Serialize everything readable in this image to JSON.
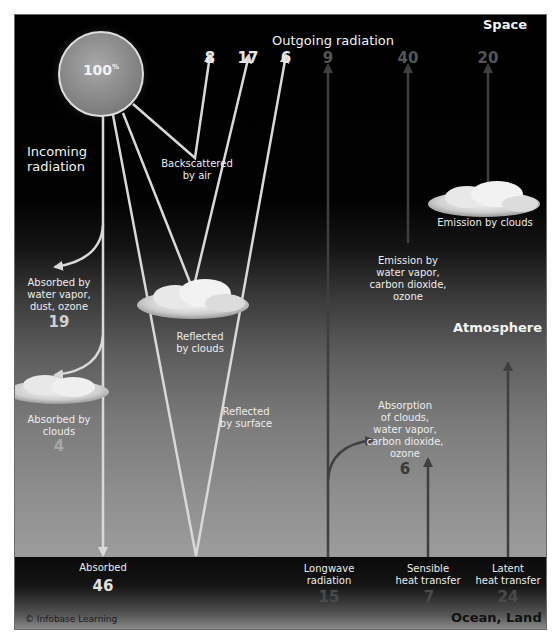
{
  "diagram": {
    "regions": {
      "space": "Space",
      "atmosphere": "Atmosphere",
      "surface": "Ocean, Land"
    },
    "headings": {
      "incoming": "Incoming\nradiation",
      "outgoing": "Outgoing radiation"
    },
    "sun": {
      "value": "100",
      "unit": "%"
    },
    "incoming": [
      {
        "id": "backscattered",
        "label": "Backscattered\nby air",
        "value": "8"
      },
      {
        "id": "reflected_clouds",
        "label": "Reflected\nby clouds",
        "value": "17"
      },
      {
        "id": "reflected_surface",
        "label": "Reflected\nby surface",
        "value": "6"
      },
      {
        "id": "absorbed_vapor",
        "label": "Absorbed by\nwater vapor,\ndust, ozone",
        "value": "19"
      },
      {
        "id": "absorbed_clouds",
        "label": "Absorbed by\nclouds",
        "value": "4"
      },
      {
        "id": "absorbed_surface",
        "label": "Absorbed",
        "value": "46"
      }
    ],
    "outgoing": [
      {
        "id": "longwave_out",
        "value": "9"
      },
      {
        "id": "emission_gases",
        "label": "Emission by\nwater vapor,\ncarbon dioxide,\nozone",
        "value": "40"
      },
      {
        "id": "emission_clouds",
        "label": "Emission by clouds",
        "value": "20"
      }
    ],
    "surface_fluxes": [
      {
        "id": "longwave",
        "label": "Longwave\nradiation",
        "value": "15"
      },
      {
        "id": "sensible",
        "label": "Sensible\nheat transfer",
        "value": "7"
      },
      {
        "id": "latent",
        "label": "Latent\nheat transfer",
        "value": "24"
      }
    ],
    "absorption_atmosphere": {
      "label": "Absorption\nof clouds,\nwater vapor,\ncarbon dioxide,\nozone",
      "value": "6"
    },
    "credit": "© Infobase Learning",
    "colors": {
      "shortwave_arrow": "#d9d9d9",
      "longwave_arrow": "#3f3f3f",
      "bright_number": "#e6e6e6",
      "dim_number": "#555555"
    }
  }
}
